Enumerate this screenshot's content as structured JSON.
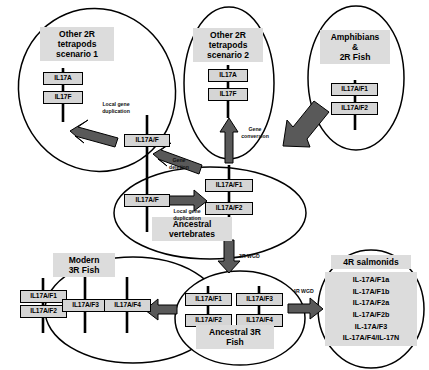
{
  "figure": {
    "type": "diagram"
  },
  "groups": [
    {
      "id": "other-2r-tetrapods-scenario-1",
      "title": "Other 2R\ntetrapods\nscenario 1",
      "genes": [
        "IL17A",
        "IL17F"
      ]
    },
    {
      "id": "other-2r-tetrapods-scenario-2",
      "title": "Other 2R\ntetrapods\nscenario 2",
      "genes": [
        "IL17A",
        "IL17F"
      ]
    },
    {
      "id": "amphibians-2r-fish",
      "title": "Amphibians\n&\n2R Fish",
      "genes": [
        "IL17A/F1",
        "IL17A/F2"
      ]
    },
    {
      "id": "ancestral-vertebrates",
      "title": "Ancestral\nvertebrates",
      "genes": [
        "IL17A/F",
        "IL17A/F1",
        "IL17A/F2"
      ]
    },
    {
      "id": "modern-3r-fish",
      "title": "Modern\n3R Fish",
      "genes": [
        "IL17A/F1",
        "IL17A/F2",
        "IL17A/F3",
        "IL17A/F4"
      ]
    },
    {
      "id": "ancestral-3r-fish",
      "title": "Ancestral 3R\nFish",
      "genes": [
        "IL17A/F1",
        "IL17A/F2",
        "IL17A/F3",
        "IL17A/F4"
      ]
    },
    {
      "id": "4r-salmonids",
      "title": "4R salmonids",
      "genes": [
        "IL-17A/F1a",
        "IL-17A/F1b",
        "IL-17A/F2a",
        "IL-17A/F2b",
        "IL-17A/F3",
        "IL-17A/F4/IL-17N"
      ]
    }
  ],
  "orphan_gene_boxes": {
    "tetrapod_scenario1_source": "IL17A/F"
  },
  "arrow_labels": {
    "local_gene_duplication_top": "Local gene\nduplication",
    "gene_deletion": "Gene\ndeletion",
    "gene_conversion": "Gene\nconversion",
    "local_gene_duplication_center": "Local gene\nduplication",
    "wgd_3r": "3R WGD",
    "wgd_4r": "4R WGD"
  },
  "colors": {
    "gene_box_fill": "#d5d5d5",
    "title_highlight": "#dcdcdc",
    "arrow_fill": "#595959",
    "outline": "#000000",
    "chromosome": "#000000",
    "background": "#ffffff"
  }
}
